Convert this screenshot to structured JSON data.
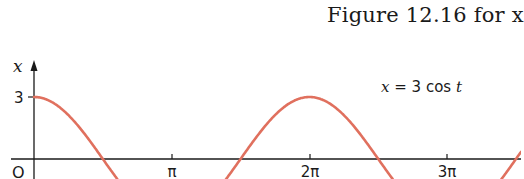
{
  "caption": {
    "text": "Figure 12.16 for x"
  },
  "chart_data": {
    "type": "line",
    "title": "",
    "equation_label": "x = 3 cos t",
    "xlabel": "t",
    "ylabel": "x",
    "origin_label": "O",
    "y_ticks": [
      {
        "value": 3,
        "label": "3"
      }
    ],
    "x_ticks": [
      {
        "value": 3.14159,
        "label": "π"
      },
      {
        "value": 6.28319,
        "label": "2π"
      },
      {
        "value": 9.42478,
        "label": "3π"
      }
    ],
    "series": [
      {
        "name": "x = 3cos t",
        "function": "3*cos(t)",
        "color": "#E0705E",
        "x": [
          0,
          1.5708,
          3.14159,
          4.71239,
          6.28319,
          7.85398,
          9.42478,
          10.9956
        ],
        "values": [
          3,
          0,
          -3,
          0,
          3,
          0,
          -3,
          0
        ]
      }
    ],
    "xlim": [
      0,
      11.2
    ],
    "ylim": [
      -1.0,
      3.5
    ],
    "grid": false,
    "legend": "none"
  },
  "axes": {
    "y_label": "x",
    "origin": "O",
    "y_tick_3": "3",
    "x_tick_pi": "π",
    "x_tick_2pi": "2π",
    "x_tick_3pi": "3π",
    "equation": "x = 3 cos t"
  },
  "colors": {
    "curve": "#E0705E",
    "axis": "#1a1a1a"
  }
}
